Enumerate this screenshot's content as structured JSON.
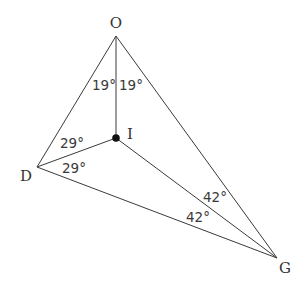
{
  "diagram": {
    "type": "triangle-incenter",
    "colors": {
      "background": "#ffffff",
      "stroke": "#3a3a3a",
      "text": "#333333",
      "point": "#111111"
    },
    "vertices": [
      {
        "id": "O",
        "label": "O",
        "x": 116,
        "y": 36,
        "label_x": 116,
        "label_y": 28
      },
      {
        "id": "D",
        "label": "D",
        "x": 37,
        "y": 167,
        "label_x": 26,
        "label_y": 181
      },
      {
        "id": "G",
        "label": "G",
        "x": 277,
        "y": 258,
        "label_x": 285,
        "label_y": 273
      }
    ],
    "incenter": {
      "id": "I",
      "label": "I",
      "x": 116,
      "y": 138,
      "label_x": 130,
      "label_y": 139,
      "radius": 3.8
    },
    "angle_labels": [
      {
        "text": "19°",
        "x": 92,
        "y": 90,
        "at": "O",
        "between": "OD-OI"
      },
      {
        "text": "19°",
        "x": 119,
        "y": 90,
        "at": "O",
        "between": "OI-OG"
      },
      {
        "text": "29°",
        "x": 60,
        "y": 148,
        "at": "D",
        "between": "DO-DI"
      },
      {
        "text": "29°",
        "x": 62,
        "y": 173,
        "at": "D",
        "between": "DI-DG"
      },
      {
        "text": "42°",
        "x": 203,
        "y": 202,
        "at": "G",
        "between": "GO-GI"
      },
      {
        "text": "42°",
        "x": 186,
        "y": 222,
        "at": "G",
        "between": "GI-GD"
      }
    ]
  }
}
